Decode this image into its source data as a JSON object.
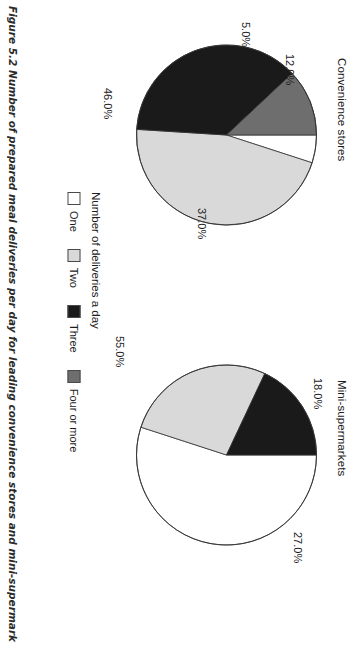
{
  "figure": {
    "caption": "Figure 5.2 Number of prepared meal deliveries per day for leading convenience stores and mini-supermarket chains"
  },
  "legend": {
    "title": "Number of deliveries a day",
    "items": [
      {
        "label": "One",
        "color": "#ffffff"
      },
      {
        "label": "Two",
        "color": "#d9d9d9"
      },
      {
        "label": "Three",
        "color": "#1a1a1a"
      },
      {
        "label": "Four or more",
        "color": "#6e6e6e"
      }
    ]
  },
  "chart_data": [
    {
      "type": "pie",
      "title": "Convenience stores",
      "categories": [
        "One",
        "Two",
        "Three",
        "Four or more"
      ],
      "values": [
        5.0,
        46.0,
        37.0,
        12.0
      ],
      "labels": [
        "5.0%",
        "46.0%",
        "37.0%",
        "12.0%"
      ],
      "colors": [
        "#ffffff",
        "#d9d9d9",
        "#1a1a1a",
        "#6e6e6e"
      ],
      "units": "percent",
      "start_angle_deg": -90,
      "direction": "clockwise",
      "legend_position": "bottom-center",
      "grid": false
    },
    {
      "type": "pie",
      "title": "Mini-supermarkets",
      "categories": [
        "One",
        "Two",
        "Three"
      ],
      "values": [
        55.0,
        27.0,
        18.0
      ],
      "labels": [
        "55.0%",
        "27.0%",
        "18.0%"
      ],
      "colors": [
        "#ffffff",
        "#d9d9d9",
        "#1a1a1a"
      ],
      "units": "percent",
      "start_angle_deg": -90,
      "direction": "clockwise",
      "legend_position": "bottom-center",
      "grid": false
    }
  ]
}
